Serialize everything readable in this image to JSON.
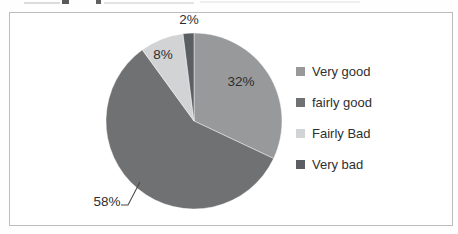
{
  "chart_data": {
    "type": "pie",
    "title": "",
    "categories": [
      "Very good",
      "fairly good",
      "Fairly Bad",
      "Very bad"
    ],
    "series": [
      {
        "name": "Very good",
        "value": 32,
        "label": "32%",
        "color": "#98999b"
      },
      {
        "name": "fairly good",
        "value": 58,
        "label": "58%",
        "color": "#707173"
      },
      {
        "name": "Fairly Bad",
        "value": 8,
        "label": "8%",
        "color": "#d2d3d4"
      },
      {
        "name": "Very bad",
        "value": 2,
        "label": "2%",
        "color": "#5b5f63"
      }
    ],
    "start_angle_deg": 0,
    "direction": "clockwise",
    "legend_position": "right",
    "data_labels": "percent",
    "label_placement": [
      "inside",
      "outside-with-leader",
      "inside-top",
      "outside-top"
    ]
  }
}
